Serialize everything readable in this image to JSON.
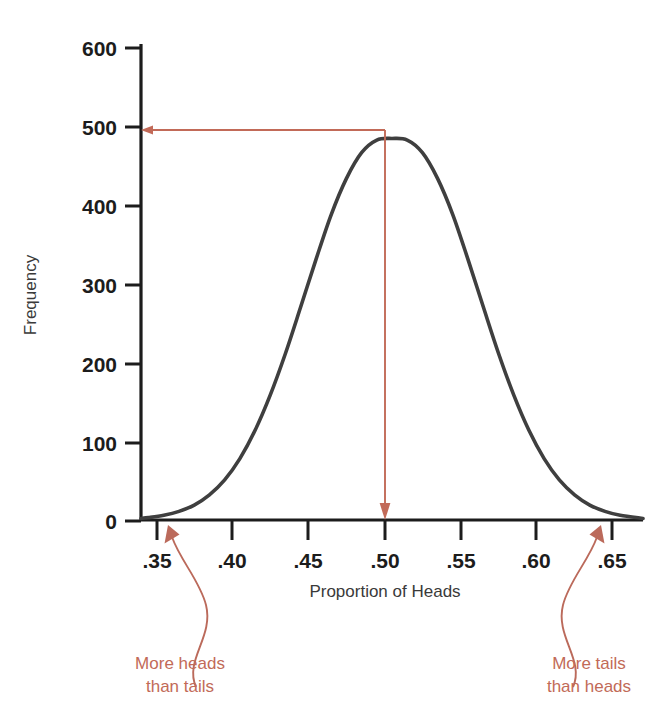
{
  "chart_data": {
    "type": "line",
    "title": "",
    "subtitle": "",
    "xlabel": "Proportion of Heads",
    "ylabel": "Frequency",
    "xlim": [
      0.335,
      0.665
    ],
    "ylim": [
      0,
      600
    ],
    "grid": false,
    "legend": null,
    "curve": {
      "name": "Sampling distribution of proportion of heads",
      "shape": "normal",
      "mean": 0.5,
      "sd": 0.05,
      "peak_value": 485,
      "x": [
        0.335,
        0.34,
        0.35,
        0.36,
        0.37,
        0.38,
        0.39,
        0.4,
        0.41,
        0.42,
        0.43,
        0.44,
        0.45,
        0.46,
        0.47,
        0.48,
        0.49,
        0.5,
        0.51,
        0.52,
        0.53,
        0.54,
        0.55,
        0.56,
        0.57,
        0.58,
        0.59,
        0.6,
        0.61,
        0.62,
        0.63,
        0.64,
        0.65,
        0.665
      ],
      "y": [
        2,
        3,
        6,
        11,
        19,
        32,
        51,
        78,
        114,
        159,
        212,
        271,
        331,
        388,
        434,
        467,
        483,
        485,
        483,
        467,
        434,
        388,
        331,
        271,
        212,
        159,
        114,
        78,
        51,
        32,
        19,
        11,
        6,
        2
      ]
    },
    "xticks": [
      0.35,
      0.4,
      0.45,
      0.5,
      0.55,
      0.6,
      0.65
    ],
    "xticklabels": [
      ".35",
      ".40",
      ".45",
      ".50",
      ".55",
      ".60",
      ".65"
    ],
    "yticks": [
      0,
      100,
      200,
      300,
      400,
      500,
      600
    ],
    "yticklabels": [
      "0",
      "100",
      "200",
      "300",
      "400",
      "500",
      "600"
    ],
    "annotations": [
      {
        "id": "peak-height-marker",
        "kind": "leader-lines",
        "description": "Red lines from curve peak to y-axis at about 485 and down to x-axis at .50",
        "from_x": 0.5,
        "from_y": 485,
        "to_y_value": 485,
        "to_x_value": 0.5
      },
      {
        "id": "left-tail-note",
        "kind": "curved-arrow-label",
        "text_line1": "More heads",
        "text_line2": "than tails",
        "points_to_x": 0.357,
        "points_to_y": 0
      },
      {
        "id": "right-tail-note",
        "kind": "curved-arrow-label",
        "text_line1": "More tails",
        "text_line2": "than heads",
        "points_to_x": 0.628,
        "points_to_y": 0
      }
    ],
    "colors": {
      "curve": "#3f3f3f",
      "axis": "#1c1c1c",
      "annotation": "#c26a58",
      "tick_label": "#1c1c1c",
      "axis_label": "#3a3a3a",
      "background": "#ffffff"
    }
  },
  "labels": {
    "ylabel": "Frequency",
    "xlabel": "Proportion of Heads",
    "ytick_600": "600",
    "ytick_500": "500",
    "ytick_400": "400",
    "ytick_300": "300",
    "ytick_200": "200",
    "ytick_100": "100",
    "ytick_0": "0",
    "xtick_35": ".35",
    "xtick_40": ".40",
    "xtick_45": ".45",
    "xtick_50": ".50",
    "xtick_55": ".55",
    "xtick_60": ".60",
    "xtick_65": ".65",
    "left_note_1": "More heads",
    "left_note_2": "than tails",
    "right_note_1": "More tails",
    "right_note_2": "than heads"
  }
}
